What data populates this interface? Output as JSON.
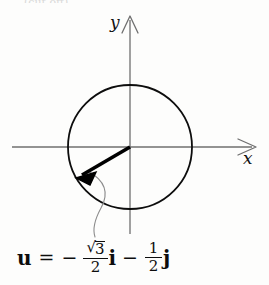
{
  "figure": {
    "kind": "unit-circle-vector-diagram",
    "background_color": "#fdfdfc",
    "caption_remnant": "(cut off)"
  },
  "axes": {
    "x_label": "x",
    "y_label": "y",
    "axis_color": "#6f6f6f",
    "origin": {
      "x": 130,
      "y": 147
    },
    "x_axis": {
      "from_x": 12,
      "to_x": 256,
      "y": 147
    },
    "y_axis": {
      "x": 130,
      "from_y": 16,
      "to_y": 234
    }
  },
  "circle": {
    "name": "unit-circle",
    "center_x": 130,
    "center_y": 147,
    "radius": 62,
    "stroke_color": "#0d0d0d",
    "stroke_width": 1.8
  },
  "vector": {
    "name": "u",
    "label": "u",
    "color": "#000000",
    "stroke_width": 3.4,
    "tail_x": 130,
    "tail_y": 147,
    "tip_x": 76,
    "tip_y": 178,
    "angle_degrees": 210,
    "components": {
      "i": "-√3/2",
      "j": "-1/2"
    }
  },
  "leader_line": {
    "name": "callout-leader",
    "color": "#8c8c8c",
    "stroke_width": 1.1,
    "from_x": 88,
    "from_y": 172,
    "to_x": 96,
    "to_y": 236
  },
  "formula": {
    "vector_name": "u",
    "equals": "=",
    "leading_minus": "−",
    "term1": {
      "sqrt_sign": "√",
      "radicand": "3",
      "denominator": "2",
      "basis": "i"
    },
    "middle_operator": "−",
    "term2": {
      "numerator": "1",
      "denominator": "2",
      "basis": "j"
    },
    "plain_text": "u = − (√3/2) i − (1/2) j"
  }
}
